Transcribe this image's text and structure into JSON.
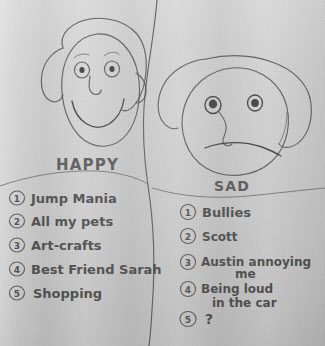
{
  "artwork": {
    "medium": "pencil on gray paper",
    "title_left": "HAPPY",
    "title_right": "SAD",
    "paper_color": "#cdcdcd",
    "ink_color": "#4a4a4a"
  },
  "faces": {
    "happy": {
      "name": "happy-face-drawing",
      "expression": "smiling",
      "features": [
        "hair",
        "eyes",
        "eyebrows",
        "nose",
        "smile"
      ]
    },
    "sad": {
      "name": "sad-face-drawing",
      "expression": "frowning",
      "features": [
        "hair",
        "eyes",
        "nose",
        "frown"
      ]
    }
  },
  "happy_list": {
    "heading": "HAPPY",
    "items": [
      {
        "number": "1",
        "text": "Jump Mania"
      },
      {
        "number": "2",
        "text": "All my pets"
      },
      {
        "number": "3",
        "text": "Art-crafts"
      },
      {
        "number": "4",
        "text": "Best Friend Sarah"
      },
      {
        "number": "5",
        "text": "Shopping"
      }
    ]
  },
  "sad_list": {
    "heading": "SAD",
    "items": [
      {
        "number": "1",
        "text": "Bullies",
        "text2": ""
      },
      {
        "number": "2",
        "text": "Scott",
        "text2": ""
      },
      {
        "number": "3",
        "text": "Austin annoying",
        "text2": "me"
      },
      {
        "number": "4",
        "text": "Being loud",
        "text2": "in the car"
      },
      {
        "number": "5",
        "text": "?",
        "text2": ""
      }
    ]
  }
}
